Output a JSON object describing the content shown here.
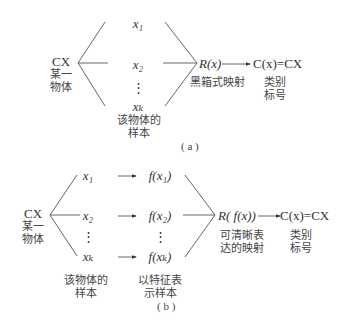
{
  "panel_a": {
    "object_code": "CX",
    "object_label": [
      "某一",
      "物体"
    ],
    "samples": [
      "x₁",
      "x₂",
      "⋮",
      "xₖ"
    ],
    "samples_label": [
      "该物体的",
      "样本"
    ],
    "mapping": "R(x)",
    "mapping_label": "黑箱式映射",
    "result": "C(x)=CX",
    "result_label": [
      "类别",
      "标号"
    ],
    "caption": "( a )"
  },
  "panel_b": {
    "object_code": "CX",
    "object_label": [
      "某一",
      "物体"
    ],
    "samples": [
      "x₁",
      "x₂",
      "⋮",
      "xₖ"
    ],
    "features": [
      "f(x₁)",
      "f(x₂)",
      "⋮",
      "f(xₖ)"
    ],
    "samples_label": [
      "该物体的",
      "样本"
    ],
    "features_label": [
      "以特征表",
      "示样本"
    ],
    "mapping": "R( f(x))",
    "mapping_label": [
      "可清晰表",
      "达的映射"
    ],
    "result": "C(x)=CX",
    "result_label": [
      "类别",
      "标号"
    ],
    "caption": "( b )"
  }
}
